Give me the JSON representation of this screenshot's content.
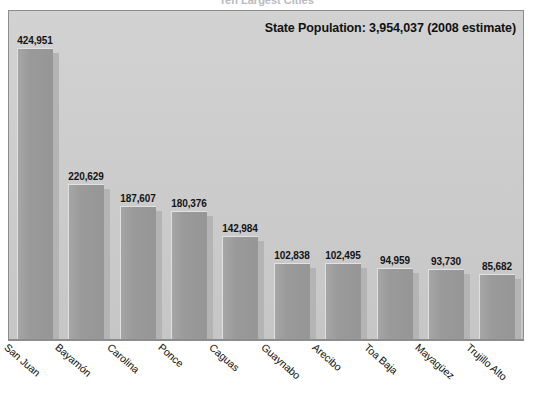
{
  "chart_title": "Ten Largest Cities",
  "annotation": "State Population: 3,954,037 (2008 estimate)",
  "colors": {
    "bar_fill": "#9a9a9a",
    "plot_background": "#cfcfcf",
    "frame_border": "#8d8d8d",
    "label_text": "#111111",
    "page_background": "#ffffff"
  },
  "chart_data": {
    "type": "bar",
    "title": "Ten Largest Cities",
    "xlabel": "",
    "ylabel": "",
    "ylim": [
      0,
      460000
    ],
    "grid": false,
    "legend": "none",
    "annotations": [
      "State Population: 3,954,037 (2008 estimate)"
    ],
    "categories": [
      "San Juan",
      "Bayamón",
      "Carolina",
      "Ponce",
      "Caguas",
      "Guaynabo",
      "Arecibo",
      "Toa Baja",
      "Mayagüez",
      "Trujillo Alto"
    ],
    "values": [
      424951,
      220629,
      187607,
      180376,
      142984,
      102838,
      102495,
      94959,
      93730,
      85682
    ],
    "value_labels": [
      "424,951",
      "220,629",
      "187,607",
      "180,376",
      "142,984",
      "102,838",
      "102,495",
      "94,959",
      "93,730",
      "85,682"
    ]
  }
}
